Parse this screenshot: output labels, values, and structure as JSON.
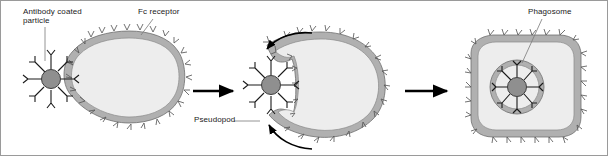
{
  "figure": {
    "border_color": "#9a9a9a",
    "background": "#ffffff"
  },
  "colors": {
    "membrane_fill": "#b0b0b0",
    "membrane_stroke": "#6e6e6e",
    "cytoplasm_fill": "#ededed",
    "cytoplasm_stroke": "#8a8a8a",
    "particle_fill": "#8f8f8f",
    "particle_stroke": "#3d3d3d",
    "antibody_stroke": "#1a1a1a",
    "receptor_stroke": "#585858",
    "arrow_color": "#000000",
    "leader_color": "#7a7a7a",
    "text_color": "#1a1a1a"
  },
  "labels": {
    "antibody_coated_particle": "Antibody coated\nparticle",
    "fc_receptor": "Fc receptor",
    "pseudopod": "Pseudopod",
    "phagosome": "Phagosome"
  },
  "panels": [
    {
      "id": "panel-1",
      "stage": "binding",
      "caption_labels": [
        "Antibody coated\nparticle",
        "Fc receptor"
      ],
      "cell_shape": "rounded-oval",
      "particle_location": "outside-left",
      "particle_spikes": 8,
      "receptor_count": 26
    },
    {
      "id": "panel-2",
      "stage": "engulfment",
      "caption_labels": [
        "Pseudopod"
      ],
      "cell_shape": "cup-shaped",
      "particle_location": "in-phagocytic-cup",
      "particle_spikes": 8,
      "receptor_count": 24,
      "curved_arrows": 2
    },
    {
      "id": "panel-3",
      "stage": "phagosome-formed",
      "caption_labels": [
        "Phagosome"
      ],
      "cell_shape": "rounded-square",
      "particle_location": "inside-phagosome",
      "particle_spikes": 8,
      "receptor_count": 24
    }
  ],
  "arrows": [
    {
      "id": "arrow-1-2",
      "direction": "right",
      "from": "panel-1",
      "to": "panel-2"
    },
    {
      "id": "arrow-2-3",
      "direction": "right",
      "from": "panel-2",
      "to": "panel-3"
    }
  ]
}
